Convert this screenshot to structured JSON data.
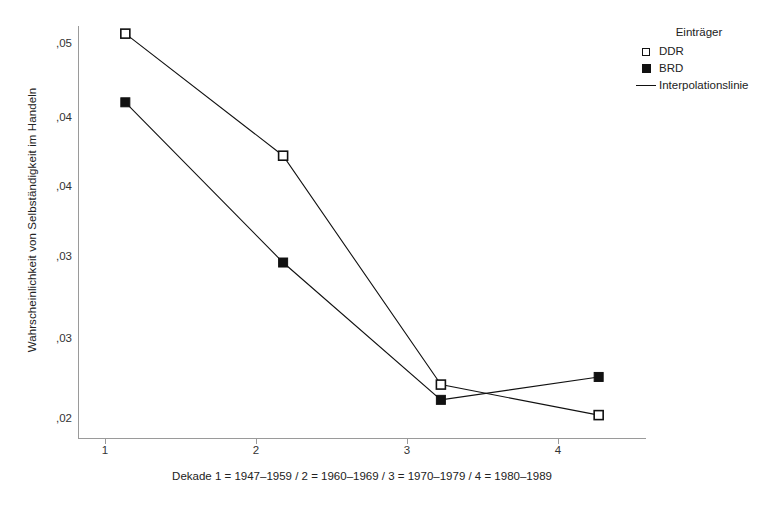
{
  "chart_data": {
    "type": "line",
    "title": "",
    "xlabel": "Dekade 1 = 1947–1959 / 2 = 1960–1969 / 3 = 1970–1979 / 4 = 1980–1989",
    "ylabel": "Wahrscheinlichkeit von Selbständigkeit im Handeln",
    "categories": [
      "1",
      "2",
      "3",
      "4"
    ],
    "x": [
      1,
      2,
      3,
      4
    ],
    "xtick_labels": [
      "1",
      "2",
      "3",
      "4"
    ],
    "ytick_labels": [
      ",05",
      ",04",
      ",04",
      ",03",
      ",03",
      ",02"
    ],
    "ytick_values": [
      0.05,
      0.045,
      0.04,
      0.035,
      0.03,
      0.025
    ],
    "ylim": [
      0.0235,
      0.0505
    ],
    "xlim": [
      0.7,
      4.3
    ],
    "grid": false,
    "legend_position": "top-right",
    "series": [
      {
        "name": "DDR",
        "marker": "open-square",
        "values": [
          0.05,
          0.042,
          0.027,
          0.025
        ]
      },
      {
        "name": "BRD",
        "marker": "filled-square",
        "values": [
          0.0455,
          0.035,
          0.026,
          0.0275
        ]
      }
    ],
    "annotations": []
  },
  "legend": {
    "title": "Einträger",
    "entries": [
      {
        "label": "DDR",
        "key": "open-square-marker"
      },
      {
        "label": "BRD",
        "key": "filled-square-marker"
      },
      {
        "label": "Interpolationslinie",
        "key": "line-marker"
      }
    ]
  }
}
